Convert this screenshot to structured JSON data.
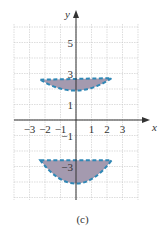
{
  "caption": "(c)",
  "colors": {
    "fill": "#a49aaf",
    "outline": "#2f87b5",
    "grid": "#c8c8c8",
    "axis": "#333333"
  },
  "chart_data": {
    "type": "area",
    "title": "",
    "xlabel": "x",
    "ylabel": "y",
    "xlim": [
      -4,
      4
    ],
    "ylim": [
      -6,
      6
    ],
    "grid": true,
    "x_ticks": [
      "-3",
      "-2",
      "-1",
      "1",
      "2",
      "3"
    ],
    "y_ticks": [
      "5",
      "3",
      "1",
      "-1",
      "-3"
    ],
    "regions": [
      {
        "name": "upper lens",
        "boundary": "dashed",
        "shaded": true,
        "points": [
          [
            -2.3,
            2.6
          ],
          [
            0,
            4.0
          ],
          [
            2.3,
            2.7
          ],
          [
            0,
            1.9
          ]
        ]
      },
      {
        "name": "lower lens",
        "boundary": "dashed",
        "shaded": true,
        "points": [
          [
            -2.3,
            -2.6
          ],
          [
            0,
            -2.0
          ],
          [
            2.3,
            -2.6
          ],
          [
            0,
            -4.1
          ]
        ]
      }
    ]
  }
}
